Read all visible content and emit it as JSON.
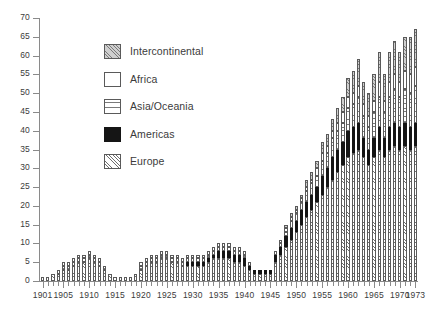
{
  "chart_data": {
    "type": "bar",
    "stacked": true,
    "title": "",
    "subtitle": "",
    "xlabel": "",
    "ylabel": "",
    "ylim": [
      0,
      70
    ],
    "ytick_step": 5,
    "yticks": [
      0,
      5,
      10,
      15,
      20,
      25,
      30,
      35,
      40,
      45,
      50,
      55,
      60,
      65,
      70
    ],
    "xlim": [
      1901,
      1973
    ],
    "xticks_labeled": [
      1901,
      1905,
      1910,
      1915,
      1920,
      1925,
      1930,
      1935,
      1940,
      1945,
      1950,
      1955,
      1960,
      1965,
      1970,
      1973
    ],
    "grid": false,
    "legend_position": "upper-left-inside",
    "categories": [
      1901,
      1902,
      1903,
      1904,
      1905,
      1906,
      1907,
      1908,
      1909,
      1910,
      1911,
      1912,
      1913,
      1914,
      1915,
      1916,
      1917,
      1918,
      1919,
      1920,
      1921,
      1922,
      1923,
      1924,
      1925,
      1926,
      1927,
      1928,
      1929,
      1930,
      1931,
      1932,
      1933,
      1934,
      1935,
      1936,
      1937,
      1938,
      1939,
      1940,
      1941,
      1942,
      1943,
      1944,
      1945,
      1946,
      1947,
      1948,
      1949,
      1950,
      1951,
      1952,
      1953,
      1954,
      1955,
      1956,
      1957,
      1958,
      1959,
      1960,
      1961,
      1962,
      1963,
      1964,
      1965,
      1966,
      1967,
      1968,
      1969,
      1970,
      1971,
      1972,
      1973
    ],
    "series": [
      {
        "name": "Europe",
        "pattern": "diagonal-hatch",
        "values": [
          1,
          1,
          2,
          2,
          3,
          3,
          4,
          5,
          5,
          6,
          5,
          4,
          3,
          2,
          1,
          1,
          1,
          1,
          2,
          3,
          4,
          5,
          5,
          6,
          6,
          5,
          5,
          4,
          4,
          4,
          4,
          4,
          5,
          6,
          6,
          6,
          6,
          5,
          5,
          4,
          3,
          2,
          2,
          2,
          2,
          5,
          7,
          9,
          11,
          13,
          15,
          17,
          19,
          21,
          23,
          25,
          27,
          29,
          31,
          33,
          34,
          35,
          33,
          31,
          33,
          35,
          33,
          35,
          36,
          35,
          36,
          35,
          36
        ]
      },
      {
        "name": "Americas",
        "pattern": "solid-black",
        "values": [
          0,
          0,
          0,
          0,
          0,
          0,
          0,
          0,
          0,
          0,
          0,
          0,
          0,
          0,
          0,
          0,
          0,
          0,
          0,
          0,
          0,
          0,
          0,
          0,
          0,
          0,
          0,
          0,
          1,
          1,
          1,
          1,
          1,
          1,
          2,
          2,
          2,
          2,
          2,
          2,
          1,
          1,
          1,
          1,
          1,
          2,
          2,
          3,
          3,
          3,
          4,
          4,
          4,
          4,
          5,
          5,
          6,
          6,
          6,
          7,
          7,
          7,
          5,
          4,
          5,
          6,
          5,
          6,
          6,
          6,
          6,
          6,
          6
        ]
      },
      {
        "name": "Asia/Oceania",
        "pattern": "horizontal-lines",
        "values": [
          0,
          0,
          0,
          0,
          1,
          1,
          1,
          1,
          1,
          1,
          1,
          1,
          1,
          0,
          0,
          0,
          0,
          0,
          0,
          1,
          1,
          1,
          1,
          1,
          1,
          1,
          1,
          1,
          1,
          1,
          1,
          1,
          1,
          1,
          1,
          1,
          1,
          1,
          1,
          1,
          1,
          0,
          0,
          0,
          0,
          1,
          1,
          1,
          2,
          2,
          2,
          3,
          3,
          3,
          4,
          4,
          5,
          5,
          5,
          6,
          6,
          7,
          6,
          6,
          7,
          8,
          7,
          8,
          9,
          8,
          9,
          9,
          10
        ]
      },
      {
        "name": "Africa",
        "pattern": "white-fill",
        "values": [
          0,
          0,
          0,
          1,
          1,
          1,
          1,
          1,
          1,
          1,
          1,
          1,
          0,
          0,
          0,
          0,
          0,
          0,
          0,
          1,
          1,
          1,
          1,
          1,
          1,
          1,
          1,
          1,
          1,
          1,
          1,
          1,
          1,
          1,
          1,
          1,
          1,
          1,
          1,
          1,
          0,
          0,
          0,
          0,
          0,
          0,
          1,
          1,
          1,
          1,
          1,
          1,
          1,
          2,
          2,
          2,
          2,
          2,
          3,
          3,
          3,
          3,
          3,
          3,
          3,
          4,
          3,
          4,
          4,
          4,
          5,
          5,
          5
        ]
      },
      {
        "name": "Intercontinental",
        "pattern": "gray-diagonal-hatch",
        "values": [
          0,
          0,
          0,
          0,
          0,
          0,
          0,
          0,
          0,
          0,
          0,
          0,
          0,
          0,
          0,
          0,
          0,
          0,
          0,
          0,
          0,
          0,
          0,
          0,
          0,
          0,
          0,
          0,
          0,
          0,
          0,
          0,
          0,
          0,
          0,
          0,
          0,
          0,
          0,
          0,
          0,
          0,
          0,
          0,
          0,
          0,
          0,
          1,
          1,
          1,
          1,
          2,
          2,
          2,
          3,
          3,
          3,
          4,
          4,
          5,
          6,
          7,
          6,
          6,
          7,
          8,
          7,
          8,
          9,
          8,
          9,
          10,
          10
        ]
      }
    ]
  },
  "legend": {
    "items": [
      {
        "label": "Intercontinental",
        "swatch": "gray-diagonal-hatch-swatch"
      },
      {
        "label": "Africa",
        "swatch": "white-fill-swatch"
      },
      {
        "label": "Asia/Oceania",
        "swatch": "horizontal-lines-swatch"
      },
      {
        "label": "Americas",
        "swatch": "solid-black-swatch"
      },
      {
        "label": "Europe",
        "swatch": "diagonal-hatch-swatch"
      }
    ]
  },
  "colors": {
    "axis": "#8a8a8a",
    "text": "#3b3b3b",
    "black_series": "#151515",
    "gray_series": "#cfcfcf",
    "hatch_line": "#6e6e6e",
    "background": "#ffffff"
  }
}
